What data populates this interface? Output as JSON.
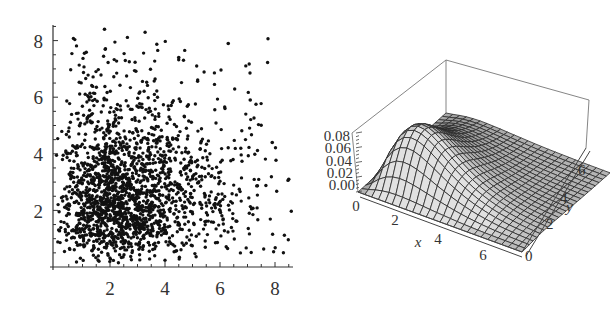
{
  "chart_data": [
    {
      "type": "scatter",
      "title": "",
      "xlabel": "",
      "ylabel": "",
      "xlim": [
        0,
        8.7
      ],
      "ylim": [
        0,
        8.5
      ],
      "x_ticks": [
        2,
        4,
        6,
        8
      ],
      "y_ticks": [
        2,
        4,
        6,
        8
      ],
      "grid": false,
      "legend": null,
      "point_count_estimate": 2000,
      "distribution": {
        "description": "bivariate cloud, dense core around (2.5, 2.5), right-skewed tails, all values positive",
        "center": [
          2.5,
          2.5
        ],
        "x_range_observed": [
          0,
          8.5
        ],
        "y_range_observed": [
          0,
          8.4
        ]
      },
      "notable_outliers": [
        {
          "x": 8.5,
          "y": 3.1
        },
        {
          "x": 7.9,
          "y": 4.4
        },
        {
          "x": 6.3,
          "y": 7.9
        },
        {
          "x": 1.8,
          "y": 8.4
        },
        {
          "x": 7.1,
          "y": 5.9
        },
        {
          "x": 4.5,
          "y": 7.4
        }
      ]
    },
    {
      "type": "surface3d",
      "title": "",
      "xlabel": "x",
      "ylabel": "y",
      "zlabel": "",
      "xlim": [
        0,
        7
      ],
      "ylim": [
        0,
        7
      ],
      "zlim": [
        0,
        0.08
      ],
      "x_ticks": [
        0,
        2,
        4,
        6
      ],
      "y_ticks": [
        0,
        2,
        4,
        6
      ],
      "z_ticks": [
        "0.00",
        "0.02",
        "0.04",
        "0.06",
        "0.08"
      ],
      "grid": false,
      "mesh": "approx 25 x 25 grid lines",
      "description": "bivariate density surface, peak ~0.075 near (x≈1.5, y≈2), decaying toward large x and y",
      "peak": {
        "x": 1.5,
        "y": 2.0,
        "z": 0.075
      }
    }
  ],
  "scatter": {
    "x_tick_labels": [
      "2",
      "4",
      "6",
      "8"
    ],
    "y_tick_labels": [
      "2",
      "4",
      "6",
      "8"
    ]
  },
  "surface": {
    "x_axis_label": "x",
    "y_axis_label": "y",
    "x_tick_labels": [
      "0",
      "2",
      "4",
      "6"
    ],
    "y_tick_labels": [
      "0",
      "2",
      "4",
      "6"
    ],
    "z_tick_labels": [
      "0.00",
      "0.02",
      "0.04",
      "0.06",
      "0.08"
    ]
  }
}
